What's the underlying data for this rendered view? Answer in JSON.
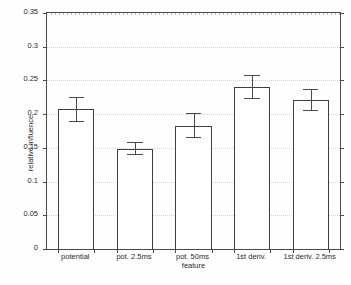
{
  "chart_data": {
    "type": "bar",
    "title": "",
    "xlabel": "feature",
    "ylabel": "relative influence",
    "categories": [
      "potential",
      "pot. 2.5ms",
      "pot. 50ms",
      "1st deriv.",
      "1st deriv. 2.5ms"
    ],
    "values": [
      0.207,
      0.149,
      0.183,
      0.241,
      0.221
    ],
    "errors_upper": [
      0.225,
      0.159,
      0.201,
      0.258,
      0.237
    ],
    "errors_lower": [
      0.19,
      0.141,
      0.166,
      0.224,
      0.206
    ],
    "error_half_widths": [
      0.0175,
      0.009,
      0.0175,
      0.017,
      0.0155
    ],
    "ylim": [
      0,
      0.35
    ],
    "yticks": [
      0,
      0.05,
      0.1,
      0.15,
      0.2,
      0.25,
      0.3,
      0.35
    ],
    "ytick_labels": [
      "0",
      "0.05",
      "0.1",
      "0.15",
      "0.2",
      "0.25",
      "0.3",
      "0.35"
    ],
    "grid": true,
    "legend": null,
    "bar_facecolor": "#ffffff",
    "bar_edgecolor": "#3f3f3f",
    "errorbar_color": "#4a4a4a",
    "axis_color": "#4a4a4a",
    "grid_color": "#d2d2d2",
    "background": "#fefefe"
  },
  "axes": {
    "y_title": "relative influence",
    "x_title": "feature"
  },
  "bars": [
    {
      "label": "potential",
      "value": 0.207,
      "err_low": 0.19,
      "err_high": 0.225
    },
    {
      "label": "pot. 2.5ms",
      "value": 0.149,
      "err_low": 0.141,
      "err_high": 0.159
    },
    {
      "label": "pot. 50ms",
      "value": 0.183,
      "err_low": 0.166,
      "err_high": 0.201
    },
    {
      "label": "1st deriv.",
      "value": 0.241,
      "err_low": 0.224,
      "err_high": 0.258
    },
    {
      "label": "1st deriv. 2.5ms",
      "value": 0.221,
      "err_low": 0.206,
      "err_high": 0.237
    }
  ]
}
